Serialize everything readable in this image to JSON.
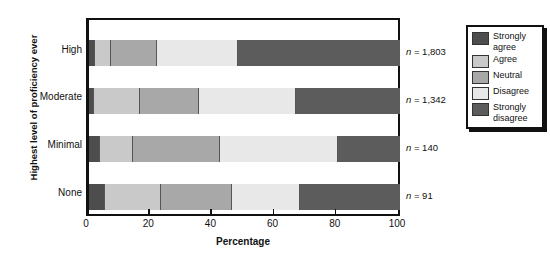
{
  "chart_data": {
    "type": "bar",
    "orientation": "horizontal",
    "stacked": true,
    "stack_mode": "percent",
    "title": "",
    "xlabel": "Percentage",
    "ylabel": "Highest level of proficiency ever",
    "xlim": [
      0,
      100
    ],
    "xticks": [
      0,
      20,
      40,
      60,
      80,
      100
    ],
    "xtick_labels": [
      "0",
      "20",
      "40",
      "60",
      "80",
      "100"
    ],
    "grid": false,
    "categories": [
      "High",
      "Moderate",
      "Minimal",
      "None"
    ],
    "category_order_top_to_bottom": [
      "High",
      "Moderate",
      "Minimal",
      "None"
    ],
    "series": [
      {
        "name": "Strongly agree",
        "color": "#4d4d4d",
        "values": [
          2,
          1.5,
          3.5,
          5
        ]
      },
      {
        "name": "Agree",
        "color": "#c9c9c9",
        "values": [
          5,
          15,
          10.5,
          18
        ]
      },
      {
        "name": "Neutral",
        "color": "#a8a8a8",
        "values": [
          15,
          19,
          28,
          23
        ]
      },
      {
        "name": "Disagree",
        "color": "#e8e8e8",
        "values": [
          26,
          31,
          38,
          22
        ]
      },
      {
        "name": "Strongly disagree",
        "color": "#5c5c5c",
        "values": [
          52,
          33.5,
          20,
          32
        ]
      }
    ],
    "annotations": [
      {
        "category": "High",
        "text": "n = 1,803"
      },
      {
        "category": "Moderate",
        "text": "n = 1,342"
      },
      {
        "category": "Minimal",
        "text": "n = 140"
      },
      {
        "category": "None",
        "text": "n = 91"
      }
    ],
    "legend": {
      "position": "right",
      "entries": [
        {
          "label": "Strongly agree",
          "color": "#4d4d4d"
        },
        {
          "label": "Agree",
          "color": "#c9c9c9"
        },
        {
          "label": "Neutral",
          "color": "#a8a8a8"
        },
        {
          "label": "Disagree",
          "color": "#e8e8e8"
        },
        {
          "label": "Strongly disagree",
          "color": "#5c5c5c"
        }
      ]
    }
  },
  "axis": {
    "y_title": "Highest level of proficiency ever",
    "x_title": "Percentage",
    "x_ticks": [
      "0",
      "20",
      "40",
      "60",
      "80",
      "100"
    ],
    "categories": [
      "High",
      "Moderate",
      "Minimal",
      "None"
    ]
  },
  "n_labels": [
    "n = 1,803",
    "n = 1,342",
    "n = 140",
    "n = 91"
  ],
  "legend_labels": [
    "Strongly agree",
    "Agree",
    "Neutral",
    "Disagree",
    "Strongly disagree"
  ],
  "colors": {
    "strongly_agree": "#4d4d4d",
    "agree": "#c9c9c9",
    "neutral": "#a8a8a8",
    "disagree": "#e8e8e8",
    "strongly_disagree": "#5c5c5c",
    "axis": "#111111",
    "background": "#ffffff"
  }
}
